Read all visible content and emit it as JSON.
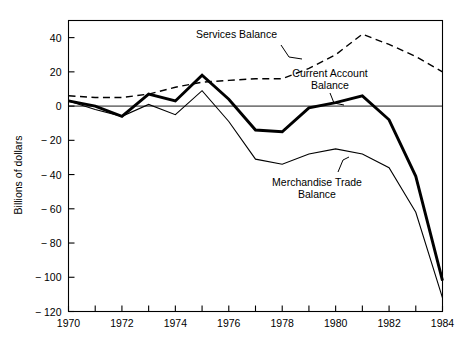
{
  "chart_data": {
    "type": "line",
    "title": "",
    "xlabel": "",
    "ylabel": "Billions of dollars",
    "xlim": [
      1970,
      1984
    ],
    "ylim": [
      -120,
      50
    ],
    "yticks": [
      40,
      20,
      0,
      -20,
      -40,
      -60,
      -80,
      -100,
      -120
    ],
    "ytick_labels": [
      "40",
      "20",
      "0",
      "− 20",
      "− 40",
      "− 60",
      "− 80",
      "− 100",
      "− 120"
    ],
    "xticks": [
      1970,
      1971,
      1972,
      1973,
      1974,
      1975,
      1976,
      1977,
      1978,
      1979,
      1980,
      1981,
      1982,
      1983,
      1984
    ],
    "xtick_labels": [
      "1970",
      "",
      "1972",
      "",
      "1974",
      "",
      "1976",
      "",
      "1978",
      "",
      "1980",
      "",
      "1982",
      "",
      "1984"
    ],
    "grid": false,
    "legend_position": "inline-annotations",
    "zero_reference_line": 0,
    "x": [
      1970,
      1971,
      1972,
      1973,
      1974,
      1975,
      1976,
      1977,
      1978,
      1979,
      1980,
      1981,
      1982,
      1983,
      1984
    ],
    "series": [
      {
        "name": "Services Balance",
        "style": "dashed",
        "values": [
          6,
          5,
          5,
          7,
          11,
          14,
          15,
          16,
          16,
          22,
          30,
          42,
          36,
          29,
          20
        ]
      },
      {
        "name": "Current Account Balance",
        "style": "thick-solid",
        "values": [
          3,
          0,
          -6,
          7,
          3,
          18,
          4,
          -14,
          -15,
          -1,
          2,
          6,
          -8,
          -41,
          -102
        ]
      },
      {
        "name": "Merchandise Trade Balance",
        "style": "thin-solid",
        "values": [
          3,
          -2,
          -6,
          1,
          -5,
          9,
          -9,
          -31,
          -34,
          -28,
          -25,
          -28,
          -36,
          -62,
          -112
        ]
      }
    ],
    "annotations": [
      {
        "text": "Services Balance",
        "target_series": "Services Balance",
        "has_leader_line": true
      },
      {
        "text_line1": "Current Account",
        "text_line2": "Balance",
        "target_series": "Current Account Balance",
        "has_leader_line": true
      },
      {
        "text_line1": "Merchandise Trade",
        "text_line2": "Balance",
        "target_series": "Merchandise Trade Balance",
        "has_leader_line": true
      }
    ]
  },
  "colors": {
    "ink": "#000000",
    "background": "#ffffff"
  }
}
